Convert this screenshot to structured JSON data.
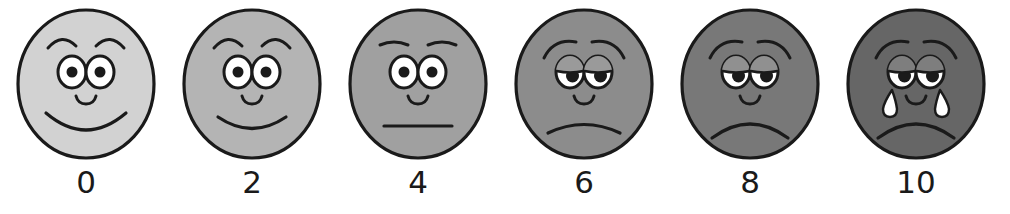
{
  "scale": {
    "name": "faces-pain-rating-scale",
    "background_color": "#ffffff",
    "stroke_color": "#1a1a1a",
    "eye_white_color": "#ffffff",
    "pupil_color": "#1a1a1a",
    "label_color": "#1a1a1a",
    "faces": [
      {
        "label": "0",
        "expression": "broad-smile",
        "fill_color": "#d2d2d2",
        "eyelid_color": "#d2d2d2",
        "center_x": 86,
        "mouth": "big-smile",
        "brows": "arched-up",
        "eyelids": false,
        "tears": 0
      },
      {
        "label": "2",
        "expression": "slight-smile",
        "fill_color": "#b4b4b4",
        "eyelid_color": "#b4b4b4",
        "center_x": 252,
        "mouth": "small-smile",
        "brows": "arched-up",
        "eyelids": false,
        "tears": 0
      },
      {
        "label": "4",
        "expression": "neutral",
        "fill_color": "#a0a0a0",
        "eyelid_color": "#a0a0a0",
        "center_x": 418,
        "mouth": "straight-line",
        "brows": "flat",
        "eyelids": false,
        "tears": 0
      },
      {
        "label": "6",
        "expression": "slight-frown",
        "fill_color": "#8c8c8c",
        "eyelid_color": "#9a9a9a",
        "center_x": 584,
        "mouth": "small-frown",
        "brows": "worried",
        "eyelids": true,
        "tears": 0
      },
      {
        "label": "8",
        "expression": "frown",
        "fill_color": "#787878",
        "eyelid_color": "#909090",
        "center_x": 750,
        "mouth": "deep-frown",
        "brows": "worried",
        "eyelids": true,
        "tears": 0
      },
      {
        "label": "10",
        "expression": "crying",
        "fill_color": "#666666",
        "eyelid_color": "#7e7e7e",
        "center_x": 916,
        "mouth": "deep-frown",
        "brows": "worried",
        "eyelids": true,
        "tears": 2
      }
    ]
  }
}
